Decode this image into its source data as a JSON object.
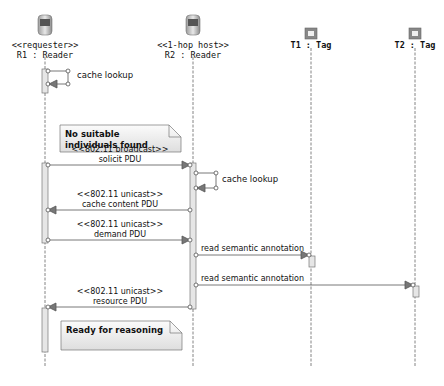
{
  "lifelines": [
    {
      "stereotype": "<<requester>>",
      "name": "R1 : Reader",
      "icon": "reader-device-icon"
    },
    {
      "stereotype": "<<1-hop host>>",
      "name": "R2 : Reader",
      "icon": "reader-device-icon"
    },
    {
      "stereotype": "",
      "name": "T1 : Tag",
      "icon": "tag-icon"
    },
    {
      "stereotype": "",
      "name": "T2 : Tag",
      "icon": "tag-icon"
    }
  ],
  "messages": [
    {
      "from": "R1",
      "to": "R1",
      "label": "cache lookup",
      "type": "self"
    },
    {
      "from": "R1",
      "to": "R2",
      "stereotype": "<<802.11 broadcast>>",
      "label": "solicit PDU"
    },
    {
      "from": "R2",
      "to": "R2",
      "label": "cache lookup",
      "type": "self"
    },
    {
      "from": "R2",
      "to": "R1",
      "stereotype": "<<802.11 unicast>>",
      "label": "cache content PDU"
    },
    {
      "from": "R1",
      "to": "R2",
      "stereotype": "<<802.11 unicast>>",
      "label": "demand PDU"
    },
    {
      "from": "R2",
      "to": "T1",
      "stereotype": "",
      "label": "read semantic annotation"
    },
    {
      "from": "R2",
      "to": "T2",
      "stereotype": "",
      "label": "read semantic annotation"
    },
    {
      "from": "R2",
      "to": "R1",
      "stereotype": "<<802.11 unicast>>",
      "label": "resource PDU"
    }
  ],
  "notes": [
    {
      "text": "No suitable individuals found"
    },
    {
      "text": "Ready for reasoning"
    }
  ],
  "colors": {
    "line": "#555555",
    "activation_fill": "#e6e6e6",
    "note_fill_top": "#fafafa",
    "note_fill_bottom": "#e0e0e0",
    "arrow_fill": "#777777"
  }
}
